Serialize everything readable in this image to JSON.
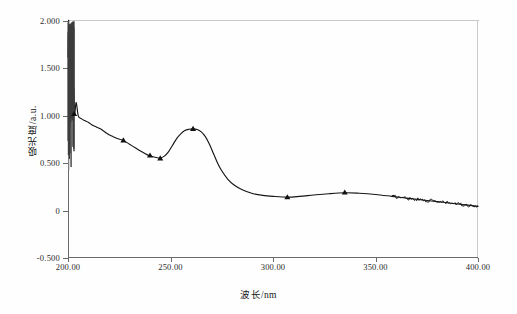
{
  "chart_data": {
    "type": "line",
    "title": "",
    "xlabel": "波长/nm",
    "ylabel": "吸光度/a.u.",
    "xlim": [
      200.0,
      400.0
    ],
    "ylim": [
      -0.5,
      2.0
    ],
    "grid": false,
    "legend": null,
    "x_tick_labels": [
      "200.00",
      "250.00",
      "300.00",
      "350.00",
      "400.00"
    ],
    "x_tick_values": [
      200,
      250,
      300,
      350,
      400
    ],
    "y_tick_labels": [
      "2.000",
      "1.500",
      "1.000",
      "0.500",
      "0",
      "-0.500"
    ],
    "y_tick_values": [
      2.0,
      1.5,
      1.0,
      0.5,
      0.0,
      -0.5
    ],
    "series": [
      {
        "name": "吸收光谱",
        "marker": "triangle",
        "marker_points": [
          {
            "x": 203.0,
            "y": 1.02
          },
          {
            "x": 227.0,
            "y": 0.74
          },
          {
            "x": 240.0,
            "y": 0.58
          },
          {
            "x": 245.0,
            "y": 0.55
          },
          {
            "x": 261.0,
            "y": 0.86
          },
          {
            "x": 307.0,
            "y": 0.14
          },
          {
            "x": 335.0,
            "y": 0.19
          }
        ],
        "x": [
          200.0,
          200.3,
          200.6,
          200.9,
          201.2,
          201.5,
          201.8,
          202.1,
          202.4,
          202.8,
          203.2,
          204.0,
          205.0,
          206.5,
          208.0,
          210.0,
          212.0,
          214.0,
          216.0,
          218.0,
          220.0,
          222.0,
          224.0,
          227.0,
          230.0,
          233.0,
          236.0,
          239.0,
          241.0,
          243.0,
          245.0,
          247.0,
          249.0,
          251.0,
          253.0,
          255.0,
          257.0,
          259.0,
          261.0,
          263.0,
          265.0,
          267.0,
          269.0,
          271.0,
          273.0,
          275.0,
          278.0,
          281.0,
          285.0,
          290.0,
          295.0,
          300.0,
          307.0,
          313.0,
          320.0,
          327.0,
          335.0,
          342.0,
          350.0,
          358.0,
          365.0,
          372.0,
          380.0,
          388.0,
          394.0,
          400.0
        ],
        "y": [
          1.62,
          2.0,
          1.22,
          1.95,
          1.3,
          1.88,
          1.12,
          1.55,
          1.05,
          1.3,
          1.02,
          1.14,
          1.0,
          0.97,
          0.95,
          0.93,
          0.9,
          0.88,
          0.86,
          0.83,
          0.8,
          0.78,
          0.76,
          0.74,
          0.7,
          0.66,
          0.62,
          0.585,
          0.57,
          0.56,
          0.555,
          0.575,
          0.62,
          0.69,
          0.76,
          0.81,
          0.845,
          0.858,
          0.862,
          0.855,
          0.83,
          0.78,
          0.7,
          0.6,
          0.5,
          0.42,
          0.33,
          0.27,
          0.22,
          0.18,
          0.16,
          0.15,
          0.142,
          0.15,
          0.165,
          0.178,
          0.188,
          0.183,
          0.17,
          0.15,
          0.132,
          0.115,
          0.095,
          0.075,
          0.06,
          0.045
        ],
        "noise_region": {
          "x_start": 358.0,
          "x_end": 400.0,
          "amplitude": 0.018
        },
        "uv_noise_region": {
          "x_start": 200.0,
          "x_end": 203.0,
          "y_min": 0.42,
          "y_max": 2.0
        }
      }
    ]
  },
  "axis_titles": {
    "x": "波长/nm",
    "y": "吸光度/a.u."
  }
}
